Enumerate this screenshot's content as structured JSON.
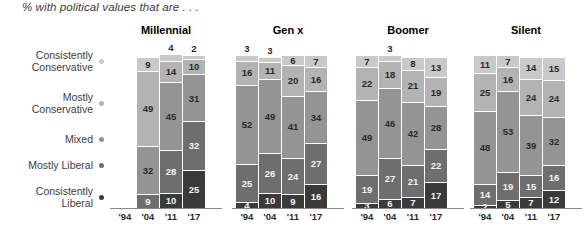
{
  "chart": {
    "title": "% with political values that are . . ."
  },
  "legend": {
    "items": [
      {
        "label": "Consistently\nConservative",
        "color": "#c9c9c9",
        "name": "consistently-conservative"
      },
      {
        "label": "Mostly\nConservative",
        "color": "#b3b3b3",
        "name": "mostly-conservative"
      },
      {
        "label": "Mixed",
        "color": "#949494",
        "name": "mixed"
      },
      {
        "label": "Mostly Liberal",
        "color": "#6e6e6e",
        "name": "mostly-liberal"
      },
      {
        "label": "Consistently\nLiberal",
        "color": "#3a3a3a",
        "name": "consistently-liberal"
      }
    ]
  },
  "chart_data": {
    "type": "bar",
    "subtype": "stacked-bar-small-multiples",
    "title": "% with political values that are . . .",
    "xlabel": "",
    "ylabel": "",
    "ylim": [
      0,
      100
    ],
    "grid": false,
    "legend_position": "left",
    "categories": [
      "'94",
      "'04",
      "'11",
      "'17"
    ],
    "series": [
      {
        "name": "Consistently Conservative",
        "color": "#c9c9c9"
      },
      {
        "name": "Mostly Conservative",
        "color": "#b3b3b3"
      },
      {
        "name": "Mixed",
        "color": "#949494"
      },
      {
        "name": "Mostly Liberal",
        "color": "#6e6e6e"
      },
      {
        "name": "Consistently Liberal",
        "color": "#3a3a3a"
      }
    ],
    "panels": [
      {
        "name": "Millennial",
        "bars": [
          {
            "year": "'94",
            "empty": true,
            "values": []
          },
          {
            "year": "'04",
            "values": [
              {
                "series": "Consistently Conservative",
                "value": 9,
                "label": "9",
                "label_outside": false
              },
              {
                "series": "Mostly Conservative",
                "value": 49,
                "label": "49",
                "label_outside": false
              },
              {
                "series": "Mixed",
                "value": 32,
                "label": "32",
                "label_outside": false
              },
              {
                "series": "Mostly Liberal",
                "value": 9,
                "label": "9",
                "label_outside": false
              }
            ]
          },
          {
            "year": "'11",
            "values": [
              {
                "series": "Consistently Conservative",
                "value": 4,
                "label": "4",
                "label_outside": true
              },
              {
                "series": "Mostly Conservative",
                "value": 14,
                "label": "14",
                "label_outside": false
              },
              {
                "series": "Mixed",
                "value": 45,
                "label": "45",
                "label_outside": false
              },
              {
                "series": "Mostly Liberal",
                "value": 28,
                "label": "28",
                "label_outside": false
              },
              {
                "series": "Consistently Liberal",
                "value": 10,
                "label": "10",
                "label_outside": false
              }
            ]
          },
          {
            "year": "'17",
            "values": [
              {
                "series": "Consistently Conservative",
                "value": 2,
                "label": "2",
                "label_outside": true
              },
              {
                "series": "Mostly Conservative",
                "value": 10,
                "label": "10",
                "label_outside": false
              },
              {
                "series": "Mixed",
                "value": 31,
                "label": "31",
                "label_outside": false
              },
              {
                "series": "Mostly Liberal",
                "value": 32,
                "label": "32",
                "label_outside": false
              },
              {
                "series": "Consistently Liberal",
                "value": 25,
                "label": "25",
                "label_outside": false
              }
            ]
          }
        ]
      },
      {
        "name": "Gen x",
        "bars": [
          {
            "year": "'94",
            "values": [
              {
                "series": "Consistently Conservative",
                "value": 3,
                "label": "3",
                "label_outside": true
              },
              {
                "series": "Mostly Conservative",
                "value": 16,
                "label": "16",
                "label_outside": false
              },
              {
                "series": "Mixed",
                "value": 52,
                "label": "52",
                "label_outside": false
              },
              {
                "series": "Mostly Liberal",
                "value": 25,
                "label": "25",
                "label_outside": false
              },
              {
                "series": "Consistently Liberal",
                "value": 4,
                "label": "4",
                "label_outside": false
              }
            ]
          },
          {
            "year": "'04",
            "values": [
              {
                "series": "Consistently Conservative",
                "value": 3,
                "label": "3",
                "label_outside": true
              },
              {
                "series": "Mostly Conservative",
                "value": 11,
                "label": "11",
                "label_outside": false
              },
              {
                "series": "Mixed",
                "value": 49,
                "label": "49",
                "label_outside": false
              },
              {
                "series": "Mostly Liberal",
                "value": 26,
                "label": "26",
                "label_outside": false
              },
              {
                "series": "Consistently Liberal",
                "value": 10,
                "label": "10",
                "label_outside": false
              }
            ]
          },
          {
            "year": "'11",
            "values": [
              {
                "series": "Consistently Conservative",
                "value": 6,
                "label": "6",
                "label_outside": false
              },
              {
                "series": "Mostly Conservative",
                "value": 20,
                "label": "20",
                "label_outside": false
              },
              {
                "series": "Mixed",
                "value": 41,
                "label": "41",
                "label_outside": false
              },
              {
                "series": "Mostly Liberal",
                "value": 24,
                "label": "24",
                "label_outside": false
              },
              {
                "series": "Consistently Liberal",
                "value": 9,
                "label": "9",
                "label_outside": false
              }
            ]
          },
          {
            "year": "'17",
            "values": [
              {
                "series": "Consistently Conservative",
                "value": 7,
                "label": "7",
                "label_outside": false
              },
              {
                "series": "Mostly Conservative",
                "value": 16,
                "label": "16",
                "label_outside": false
              },
              {
                "series": "Mixed",
                "value": 34,
                "label": "34",
                "label_outside": false
              },
              {
                "series": "Mostly Liberal",
                "value": 27,
                "label": "27",
                "label_outside": false
              },
              {
                "series": "Consistently Liberal",
                "value": 16,
                "label": "16",
                "label_outside": false
              }
            ]
          }
        ]
      },
      {
        "name": "Boomer",
        "bars": [
          {
            "year": "'94",
            "values": [
              {
                "series": "Consistently Conservative",
                "value": 7,
                "label": "7",
                "label_outside": false
              },
              {
                "series": "Mostly Conservative",
                "value": 22,
                "label": "22",
                "label_outside": false
              },
              {
                "series": "Mixed",
                "value": 49,
                "label": "49",
                "label_outside": false
              },
              {
                "series": "Mostly Liberal",
                "value": 19,
                "label": "19",
                "label_outside": false
              },
              {
                "series": "Consistently Liberal",
                "value": 3,
                "label": "3",
                "label_outside": false
              }
            ]
          },
          {
            "year": "'04",
            "values": [
              {
                "series": "Consistently Conservative",
                "value": 3,
                "label": "3",
                "label_outside": true
              },
              {
                "series": "Mostly Conservative",
                "value": 18,
                "label": "18",
                "label_outside": false
              },
              {
                "series": "Mixed",
                "value": 46,
                "label": "46",
                "label_outside": false
              },
              {
                "series": "Mostly Liberal",
                "value": 27,
                "label": "27",
                "label_outside": false
              },
              {
                "series": "Consistently Liberal",
                "value": 6,
                "label": "6",
                "label_outside": false
              }
            ]
          },
          {
            "year": "'11",
            "values": [
              {
                "series": "Consistently Conservative",
                "value": 8,
                "label": "8",
                "label_outside": false
              },
              {
                "series": "Mostly Conservative",
                "value": 21,
                "label": "21",
                "label_outside": false
              },
              {
                "series": "Mixed",
                "value": 42,
                "label": "42",
                "label_outside": false
              },
              {
                "series": "Mostly Liberal",
                "value": 21,
                "label": "21",
                "label_outside": false
              },
              {
                "series": "Consistently Liberal",
                "value": 7,
                "label": "7",
                "label_outside": false
              }
            ]
          },
          {
            "year": "'17",
            "values": [
              {
                "series": "Consistently Conservative",
                "value": 13,
                "label": "13",
                "label_outside": false
              },
              {
                "series": "Mostly Conservative",
                "value": 19,
                "label": "19",
                "label_outside": false
              },
              {
                "series": "Mixed",
                "value": 28,
                "label": "28",
                "label_outside": false
              },
              {
                "series": "Mostly Liberal",
                "value": 22,
                "label": "22",
                "label_outside": false
              },
              {
                "series": "Consistently Liberal",
                "value": 17,
                "label": "17",
                "label_outside": false
              }
            ]
          }
        ]
      },
      {
        "name": "Silent",
        "bars": [
          {
            "year": "'94",
            "values": [
              {
                "series": "Consistently Conservative",
                "value": 11,
                "label": "11",
                "label_outside": false
              },
              {
                "series": "Mostly Conservative",
                "value": 25,
                "label": "25",
                "label_outside": false
              },
              {
                "series": "Mixed",
                "value": 48,
                "label": "48",
                "label_outside": false
              },
              {
                "series": "Mostly Liberal",
                "value": 14,
                "label": "14",
                "label_outside": false
              },
              {
                "series": "Consistently Liberal",
                "value": 2,
                "label": "2",
                "label_outside": false
              }
            ]
          },
          {
            "year": "'04",
            "values": [
              {
                "series": "Consistently Conservative",
                "value": 7,
                "label": "7",
                "label_outside": false
              },
              {
                "series": "Mostly Conservative",
                "value": 16,
                "label": "16",
                "label_outside": false
              },
              {
                "series": "Mixed",
                "value": 53,
                "label": "53",
                "label_outside": false
              },
              {
                "series": "Mostly Liberal",
                "value": 19,
                "label": "19",
                "label_outside": false
              },
              {
                "series": "Consistently Liberal",
                "value": 5,
                "label": "5",
                "label_outside": false
              }
            ]
          },
          {
            "year": "'11",
            "values": [
              {
                "series": "Consistently Conservative",
                "value": 14,
                "label": "14",
                "label_outside": false
              },
              {
                "series": "Mostly Conservative",
                "value": 24,
                "label": "24",
                "label_outside": false
              },
              {
                "series": "Mixed",
                "value": 39,
                "label": "39",
                "label_outside": false
              },
              {
                "series": "Mostly Liberal",
                "value": 15,
                "label": "15",
                "label_outside": false
              },
              {
                "series": "Consistently Liberal",
                "value": 7,
                "label": "7",
                "label_outside": false
              }
            ]
          },
          {
            "year": "'17",
            "values": [
              {
                "series": "Consistently Conservative",
                "value": 15,
                "label": "15",
                "label_outside": false
              },
              {
                "series": "Mostly Conservative",
                "value": 24,
                "label": "24",
                "label_outside": false
              },
              {
                "series": "Mixed",
                "value": 32,
                "label": "32",
                "label_outside": false
              },
              {
                "series": "Mostly Liberal",
                "value": 16,
                "label": "16",
                "label_outside": false
              },
              {
                "series": "Consistently Liberal",
                "value": 12,
                "label": "12",
                "label_outside": false
              }
            ]
          }
        ]
      }
    ]
  }
}
